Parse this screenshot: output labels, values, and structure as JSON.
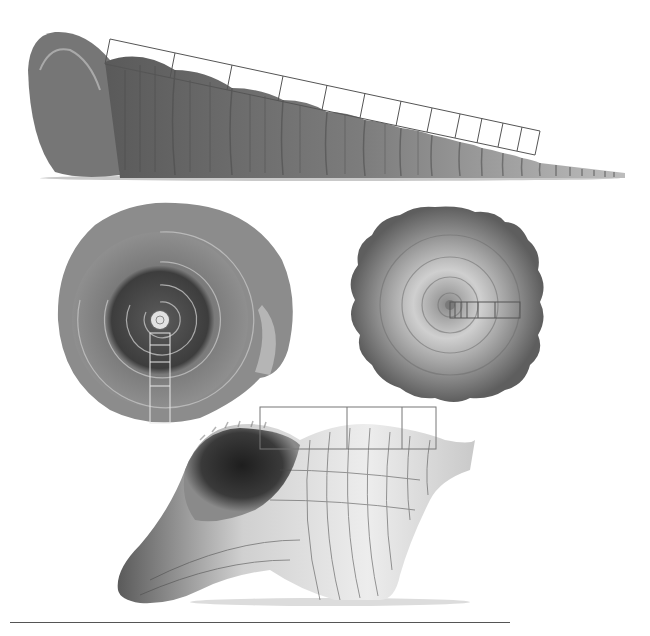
{
  "figure": {
    "colors": {
      "background": "#ffffff",
      "overlay_dark": "#555555",
      "overlay_light": "#e8e8e8",
      "shell_dark": "#3a3a3a",
      "shell_mid": "#8a8a8a",
      "shell_light": "#d6d6d6"
    },
    "shells": [
      {
        "name": "turritella-auger-shell",
        "view": "side",
        "overlay_segments": 12,
        "segment_dividers_x": [
          110,
          175,
          232,
          283,
          327,
          365,
          401,
          432,
          460,
          482,
          503,
          522,
          540
        ]
      },
      {
        "name": "planispiral-snail-shell",
        "view": "apical",
        "overlay_segments": 4
      },
      {
        "name": "spiny-spiral-shell",
        "view": "apical",
        "overlay_segments": 6
      },
      {
        "name": "horse-conch-shell",
        "view": "side",
        "overlay_segments": 3
      }
    ]
  }
}
